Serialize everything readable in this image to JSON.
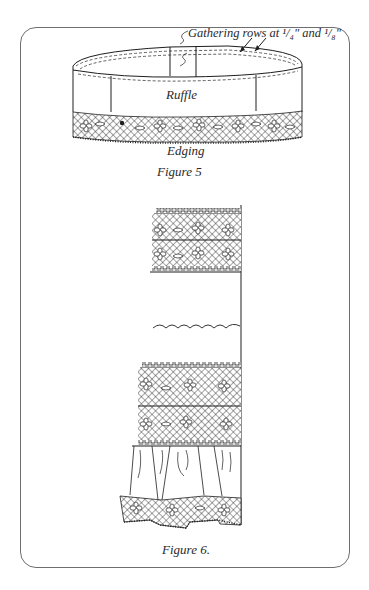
{
  "figure5": {
    "callout": "Gathering rows at ¹/₄\" and ¹/₈\"",
    "ruffle_label": "Ruffle",
    "edging_label": "Edging",
    "caption": "Figure 5"
  },
  "figure6": {
    "caption": "Figure 6."
  },
  "colors": {
    "ink": "#1e1e1e",
    "frame": "#6e6e6e",
    "background": "#ffffff"
  }
}
